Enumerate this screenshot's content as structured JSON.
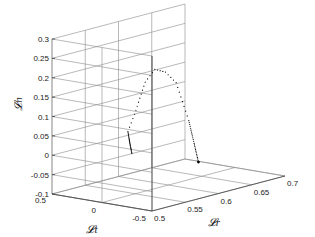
{
  "chart_data": {
    "type": "scatter3d",
    "title": "",
    "xlabel": "𝓛r",
    "ylabel": "𝓛t",
    "zlabel": "𝓛n",
    "xlim": [
      0.5,
      0.7
    ],
    "ylim": [
      -0.5,
      0.5
    ],
    "zlim": [
      -0.1,
      0.3
    ],
    "x_ticks": [
      "0.5",
      "0.55",
      "0.6",
      "0.65",
      "0.7"
    ],
    "y_ticks": [
      "0.5",
      "0",
      "-0.5"
    ],
    "z_ticks": [
      "0.3",
      "0.25",
      "0.2",
      "0.15",
      "0.1",
      "0.05",
      "0",
      "-0.05",
      "-0.1"
    ],
    "grid": true,
    "series": [
      {
        "name": "trajectory",
        "marker": "dot",
        "color": "#000000",
        "description": "Arc trajectory: starts near (0.58, 0.1, 0.0) rising to peak ~0.2 then descending to end near (0.62,-0.1,-0.05)",
        "points": [
          {
            "x": 0.56,
            "y": 0.1,
            "z": -0.005
          },
          {
            "x": 0.56,
            "y": 0.12,
            "z": 0.02
          },
          {
            "x": 0.56,
            "y": 0.14,
            "z": 0.05
          },
          {
            "x": 0.57,
            "y": 0.14,
            "z": 0.09
          },
          {
            "x": 0.575,
            "y": 0.12,
            "z": 0.13
          },
          {
            "x": 0.58,
            "y": 0.1,
            "z": 0.17
          },
          {
            "x": 0.59,
            "y": 0.07,
            "z": 0.2
          },
          {
            "x": 0.6,
            "y": 0.03,
            "z": 0.19
          },
          {
            "x": 0.61,
            "y": -0.01,
            "z": 0.16
          },
          {
            "x": 0.615,
            "y": -0.04,
            "z": 0.11
          },
          {
            "x": 0.62,
            "y": -0.07,
            "z": 0.06
          },
          {
            "x": 0.625,
            "y": -0.09,
            "z": 0.0
          },
          {
            "x": 0.63,
            "y": -0.1,
            "z": -0.05
          }
        ]
      }
    ]
  }
}
